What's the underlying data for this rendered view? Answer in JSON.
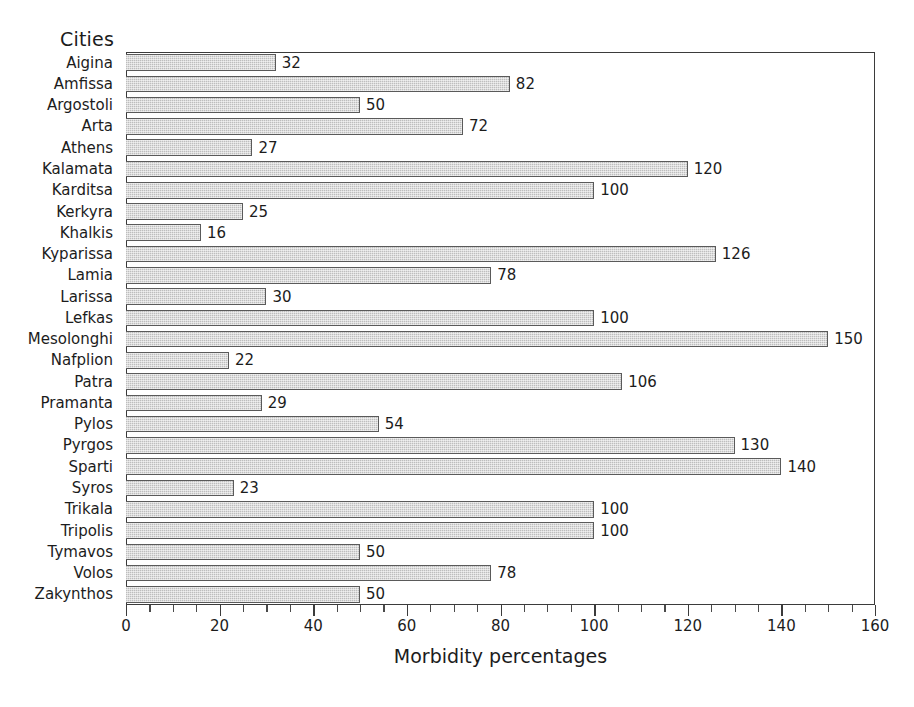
{
  "chart_data": {
    "type": "bar",
    "orientation": "horizontal",
    "title": "",
    "xlabel": "Morbidity percentages",
    "ylabel": "Cities",
    "xlim": [
      0,
      160
    ],
    "ylim": null,
    "grid": false,
    "legend": null,
    "x_ticks": [
      0,
      20,
      40,
      60,
      80,
      100,
      120,
      140,
      160
    ],
    "x_tick_labels": [
      "0",
      "20",
      "40",
      "60",
      "80",
      "100",
      "120",
      "140",
      "160"
    ],
    "x_minor_tick_step": 5,
    "bar_fill_color": "#dcdcdc",
    "bar_edge_color": "#5a5a5a",
    "axis_color": "#3b3b3b",
    "text_color": "#1c1c1c",
    "background_color": "#ffffff",
    "data_labels_shown": true,
    "categories": [
      "Aigina",
      "Amfissa",
      "Argostoli",
      "Arta",
      "Athens",
      "Kalamata",
      "Karditsa",
      "Kerkyra",
      "Khalkis",
      "Kyparissa",
      "Lamia",
      "Larissa",
      "Lefkas",
      "Mesolonghi",
      "Nafplion",
      "Patra",
      "Pramanta",
      "Pylos",
      "Pyrgos",
      "Sparti",
      "Syros",
      "Trikala",
      "Tripolis",
      "Tymavos",
      "Volos",
      "Zakynthos"
    ],
    "values": [
      32,
      82,
      50,
      72,
      27,
      120,
      100,
      25,
      16,
      126,
      78,
      30,
      100,
      150,
      22,
      106,
      29,
      54,
      130,
      140,
      23,
      100,
      100,
      50,
      78,
      50
    ],
    "value_labels": [
      "32",
      "82",
      "50",
      "72",
      "27",
      "120",
      "100",
      "25",
      "16",
      "126",
      "78",
      "30",
      "100",
      "150",
      "22",
      "106",
      "29",
      "54",
      "130",
      "140",
      "23",
      "100",
      "100",
      "50",
      "78",
      "50"
    ]
  }
}
